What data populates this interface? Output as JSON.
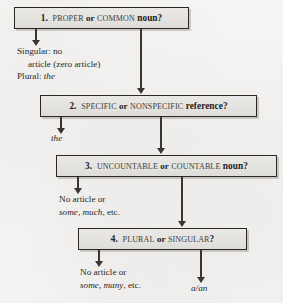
{
  "diagram": {
    "type": "flowchart",
    "background_color": "#f4f3f1",
    "box_fill_color": "#e6e5e2",
    "box_border_color": "#2a2724",
    "ink_color": "#26231f"
  },
  "steps": [
    {
      "id": "step-1",
      "number": "1.",
      "term_a": "proper",
      "conjunction": "or",
      "term_b": "common",
      "tail": "noun?",
      "full_label": "1. PROPER or COMMON noun?"
    },
    {
      "id": "step-2",
      "number": "2.",
      "term_a": "specific",
      "conjunction": "or",
      "term_b": "nonspecific",
      "tail": "reference?",
      "full_label": "2. SPECIFIC or NONSPECIFIC reference?"
    },
    {
      "id": "step-3",
      "number": "3.",
      "term_a": "uncountable",
      "conjunction": "or",
      "term_b": "countable",
      "tail": "noun?",
      "full_label": "3. UNCOUNTABLE or COUNTABLE noun?"
    },
    {
      "id": "step-4",
      "number": "4.",
      "term_a": "plural",
      "conjunction": "or",
      "term_b": "singular",
      "tail": "?",
      "full_label": "4. PLURAL or SINGULAR?"
    }
  ],
  "outcomes": {
    "proper_noun": {
      "line1": "Singular: no",
      "line2_indent": "article (zero article)",
      "line3_prefix": "Plural: ",
      "line3_italic": "the"
    },
    "specific_reference": {
      "italic": "the"
    },
    "uncountable_noun": {
      "line1": "No article or",
      "line2_italic": "some, much",
      "line2_tail": ", etc."
    },
    "plural_noun": {
      "line1": "No article or",
      "line2_italic": "some, many",
      "line2_tail": ", etc."
    },
    "singular_countable": {
      "italic": "a/an"
    }
  },
  "connectors": [
    {
      "name": "step-1-to-proper-outcome",
      "direction": "down"
    },
    {
      "name": "step-1-to-step-2",
      "direction": "down"
    },
    {
      "name": "step-2-to-specific-outcome",
      "direction": "down"
    },
    {
      "name": "step-2-to-step-3",
      "direction": "down"
    },
    {
      "name": "step-3-to-uncountable-outcome",
      "direction": "down"
    },
    {
      "name": "step-3-to-step-4",
      "direction": "down"
    },
    {
      "name": "step-4-to-plural-outcome",
      "direction": "down"
    },
    {
      "name": "step-4-to-singular-outcome",
      "direction": "down"
    }
  ]
}
